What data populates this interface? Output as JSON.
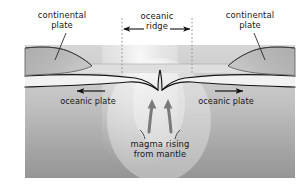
{
  "figure": {
    "kind": "geology-cross-section",
    "canvas": {
      "width": 308,
      "height": 186
    }
  },
  "labels": {
    "continental_plate_left": "continental\nplate",
    "continental_plate_right": "continental\nplate",
    "oceanic_ridge": "oceanic\nridge",
    "oceanic_plate_left": "oceanic plate",
    "oceanic_plate_right": "oceanic plate",
    "magma": "magma rising\nfrom mantle"
  },
  "annotations": {
    "ridge_span_arrow": "double-headed-horizontal-arrow",
    "plate_motion_left": "left-arrow",
    "plate_motion_right": "right-arrow",
    "magma_flow": "two-up-arrows",
    "ridge_boundary_lines": "dotted-vertical-guides"
  },
  "colors": {
    "page_background": "#ffffff",
    "mantle_top": "#d3d3d3",
    "mantle_bottom": "#9a9a9a",
    "continental_plate_fill": "#b5b5b5",
    "oceanic_plate_fill": "#efefef",
    "water_band": "#dcdcdc",
    "outline": "#1a1a1a",
    "guide_line": "#8c8c8c",
    "text": "#161616"
  }
}
